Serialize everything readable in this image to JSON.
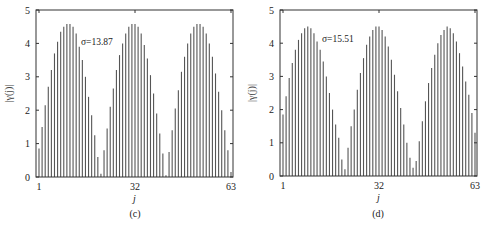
{
  "chart_data": [
    {
      "type": "bar",
      "panel_label": "(c)",
      "annotation": "σ=13.87",
      "xlabel": "j",
      "ylabel": "|γ(j)|",
      "ylim": [
        0,
        5
      ],
      "yticks": [
        "0",
        "1",
        "2",
        "3",
        "4",
        "5"
      ],
      "xticks": [
        "1",
        "32",
        "63"
      ],
      "xlim": [
        1,
        63
      ],
      "grid": false,
      "x": [
        1,
        2,
        3,
        4,
        5,
        6,
        7,
        8,
        9,
        10,
        11,
        12,
        13,
        14,
        15,
        16,
        17,
        18,
        19,
        20,
        21,
        22,
        23,
        24,
        25,
        26,
        27,
        28,
        29,
        30,
        31,
        32,
        33,
        34,
        35,
        36,
        37,
        38,
        39,
        40,
        41,
        42,
        43,
        44,
        45,
        46,
        47,
        48,
        49,
        50,
        51,
        52,
        53,
        54,
        55,
        56,
        57,
        58,
        59,
        60,
        61,
        62,
        63
      ],
      "values": [
        0.85,
        1.5,
        2.15,
        2.7,
        3.2,
        3.7,
        4.05,
        4.35,
        4.5,
        4.58,
        4.58,
        4.5,
        4.3,
        3.9,
        3.5,
        3.0,
        2.4,
        1.85,
        1.25,
        0.6,
        0.1,
        0.8,
        1.45,
        2.1,
        2.65,
        3.2,
        3.65,
        4.0,
        4.3,
        4.5,
        4.58,
        4.58,
        4.5,
        4.3,
        3.95,
        3.55,
        3.05,
        2.5,
        1.9,
        1.3,
        0.7,
        0.05,
        0.75,
        1.4,
        2.05,
        2.6,
        3.15,
        3.6,
        4.0,
        4.3,
        4.5,
        4.58,
        4.58,
        4.5,
        4.3,
        4.0,
        3.6,
        3.1,
        2.55,
        2.0,
        1.4,
        0.8,
        0.15
      ]
    },
    {
      "type": "bar",
      "panel_label": "(d)",
      "annotation": "σ=15.51",
      "xlabel": "j",
      "ylabel": "|γ(j)|",
      "ylim": [
        0,
        5
      ],
      "yticks": [
        "0",
        "1",
        "2",
        "3",
        "4",
        "5"
      ],
      "xticks": [
        "1",
        "32",
        "63"
      ],
      "xlim": [
        1,
        63
      ],
      "grid": false,
      "x": [
        1,
        2,
        3,
        4,
        5,
        6,
        7,
        8,
        9,
        10,
        11,
        12,
        13,
        14,
        15,
        16,
        17,
        18,
        19,
        20,
        21,
        22,
        23,
        24,
        25,
        26,
        27,
        28,
        29,
        30,
        31,
        32,
        33,
        34,
        35,
        36,
        37,
        38,
        39,
        40,
        41,
        42,
        43,
        44,
        45,
        46,
        47,
        48,
        49,
        50,
        51,
        52,
        53,
        54,
        55,
        56,
        57,
        58,
        59,
        60,
        61,
        62,
        63
      ],
      "values": [
        1.85,
        2.4,
        2.95,
        3.4,
        3.8,
        4.1,
        4.3,
        4.45,
        4.5,
        4.45,
        4.3,
        4.05,
        3.8,
        3.45,
        3.0,
        2.5,
        2.0,
        1.55,
        1.15,
        0.5,
        0.2,
        0.85,
        1.5,
        2.0,
        2.6,
        3.1,
        3.55,
        3.95,
        4.2,
        4.4,
        4.5,
        4.5,
        4.4,
        4.2,
        3.9,
        3.5,
        3.05,
        2.55,
        2.05,
        1.55,
        1.0,
        0.55,
        0.25,
        0.45,
        1.05,
        1.65,
        2.25,
        2.8,
        3.25,
        3.65,
        4.0,
        4.25,
        4.4,
        4.5,
        4.45,
        4.3,
        4.05,
        3.7,
        3.3,
        2.85,
        2.45,
        1.9,
        1.3
      ]
    }
  ],
  "panels": [
    {
      "annotation": "σ=13.87",
      "caption": "(c)",
      "xlabel": "j",
      "ylabel": "|γ(j)|",
      "xticks": [
        "1",
        "32",
        "63"
      ],
      "yticks": [
        "0",
        "1",
        "2",
        "3",
        "4",
        "5"
      ]
    },
    {
      "annotation": "σ=15.51",
      "caption": "(d)",
      "xlabel": "j",
      "ylabel": "|γ(j)|",
      "xticks": [
        "1",
        "32",
        "63"
      ],
      "yticks": [
        "0",
        "1",
        "2",
        "3",
        "4",
        "5"
      ]
    }
  ]
}
